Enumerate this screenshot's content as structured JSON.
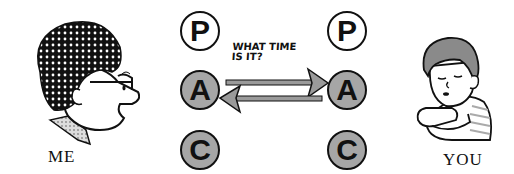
{
  "figures": {
    "left": {
      "label": "ME"
    },
    "right": {
      "label": "YOU"
    }
  },
  "ego_states": {
    "left": [
      {
        "letter": "P",
        "style": "outline"
      },
      {
        "letter": "A",
        "style": "gray"
      },
      {
        "letter": "C",
        "style": "gray"
      }
    ],
    "right": [
      {
        "letter": "P",
        "style": "outline"
      },
      {
        "letter": "A",
        "style": "gray"
      },
      {
        "letter": "C",
        "style": "gray"
      }
    ]
  },
  "transaction": {
    "message_line1": "WHAT TIME",
    "message_line2": "IS IT?",
    "arrows": [
      {
        "from": "left.A",
        "to": "right.A",
        "direction": "right"
      },
      {
        "from": "right.A",
        "to": "left.A",
        "direction": "left"
      }
    ]
  },
  "colors": {
    "ink": "#111111",
    "gray_fill": "#a6a6a6",
    "arrow_fill": "#9a9a9a"
  }
}
